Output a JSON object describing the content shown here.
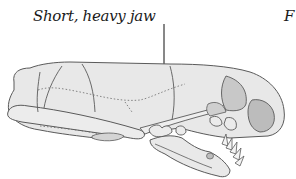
{
  "figure": {
    "annotations": [
      {
        "id": "jaw",
        "text": "Short, heavy jaw"
      },
      {
        "id": "truncated-right",
        "text": "F"
      }
    ],
    "colors": {
      "outline": "#5a5a5a",
      "fill": "#e8e8e8",
      "shade": "#c4c4c4",
      "leader_line": "#111111"
    }
  }
}
